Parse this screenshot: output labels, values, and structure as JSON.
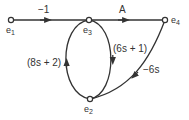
{
  "diagram": {
    "type": "signal-flow-graph",
    "nodes": [
      {
        "id": "e1",
        "label": "e",
        "sub": "1"
      },
      {
        "id": "e2",
        "label": "e",
        "sub": "2"
      },
      {
        "id": "e3",
        "label": "e",
        "sub": "3"
      },
      {
        "id": "e4",
        "label": "e",
        "sub": "4"
      }
    ],
    "edges": [
      {
        "from": "e1",
        "to": "e3",
        "gain": "−1"
      },
      {
        "from": "e3",
        "to": "e4",
        "gain": "A"
      },
      {
        "from": "e2",
        "to": "e3",
        "gain": "(8s + 2)"
      },
      {
        "from": "e3",
        "to": "e2",
        "gain": "(6s + 1)"
      },
      {
        "from": "e4",
        "to": "e2",
        "gain": "−6s"
      }
    ],
    "colors": {
      "line": "#333333",
      "background": "#ffffff"
    }
  }
}
